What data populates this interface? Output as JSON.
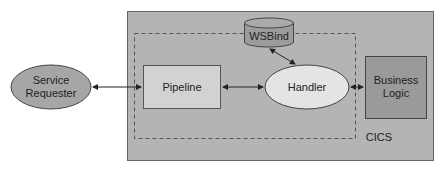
{
  "diagram": {
    "service_requester": {
      "label_line1": "Service",
      "label_line2": "Requester"
    },
    "pipeline": {
      "label": "Pipeline"
    },
    "handler": {
      "label": "Handler"
    },
    "wsbind": {
      "label": "WSBind"
    },
    "business_logic": {
      "label_line1": "Business",
      "label_line2": "Logic"
    },
    "container": {
      "label": "CICS"
    }
  },
  "colors": {
    "cics_box": "#b4b4b4",
    "service_requester": "#a6a6a6",
    "pipeline": "#d2d2d2",
    "handler": "#e4e4e4",
    "wsbind": "#9c9c9c",
    "business_logic": "#9a9a9a"
  }
}
